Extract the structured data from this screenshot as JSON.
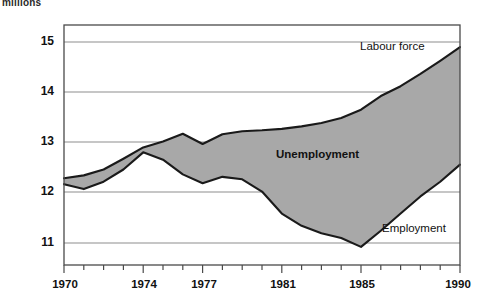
{
  "chart_data": {
    "type": "area",
    "title": "",
    "subtitle": "",
    "ylabel": "millions",
    "xlabel": "",
    "xlim": [
      1970,
      1990
    ],
    "ylim": [
      10.55,
      15.45
    ],
    "grid": true,
    "legend_position": "inline-annotations",
    "xticks": [
      1970,
      1974,
      1977,
      1981,
      1985,
      1990
    ],
    "xtick_labels": [
      "1970",
      "1974",
      "1977",
      "1981",
      "1985",
      "1990"
    ],
    "xminor_ticks": [
      1971,
      1972,
      1973,
      1975,
      1976,
      1978,
      1979,
      1980,
      1982,
      1983,
      1984,
      1986,
      1987,
      1988,
      1989
    ],
    "yticks": [
      11,
      12,
      13,
      14,
      15
    ],
    "ytick_labels": [
      "11",
      "12",
      "13",
      "14",
      "15"
    ],
    "x": [
      1970,
      1971,
      1972,
      1973,
      1974,
      1975,
      1976,
      1977,
      1978,
      1979,
      1980,
      1981,
      1982,
      1983,
      1984,
      1985,
      1986,
      1987,
      1988,
      1989,
      1990
    ],
    "series": [
      {
        "name": "Labour force",
        "values": [
          12.32,
          12.38,
          12.5,
          12.72,
          12.95,
          13.07,
          13.23,
          13.02,
          13.22,
          13.28,
          13.3,
          13.33,
          13.38,
          13.45,
          13.55,
          13.72,
          14.0,
          14.2,
          14.45,
          14.72,
          15.0
        ]
      },
      {
        "name": "Employment",
        "values": [
          12.2,
          12.1,
          12.25,
          12.5,
          12.85,
          12.7,
          12.4,
          12.22,
          12.35,
          12.3,
          12.05,
          11.6,
          11.35,
          11.2,
          11.1,
          10.92,
          11.25,
          11.6,
          11.95,
          12.25,
          12.6
        ]
      }
    ],
    "shaded_band": {
      "name": "Unemployment",
      "between": [
        "Labour force",
        "Employment"
      ],
      "color": "#a8a8a8"
    },
    "annotations": [
      {
        "text": "Labour force",
        "x": 1984.0,
        "y": 14.62,
        "bold": false
      },
      {
        "text": "Unemployment",
        "x": 1980.6,
        "y": 12.87,
        "bold": true
      },
      {
        "text": "Employment",
        "x": 1986.6,
        "y": 11.12,
        "bold": false
      }
    ],
    "colors": {
      "line": "#1a1a1a",
      "band": "#a8a8a8",
      "grid": "#8d8d8d",
      "frame": "#4a4a4a",
      "background": "#ffffff"
    }
  },
  "labels": {
    "yaxis_title": "millions",
    "labour_force": "Labour force",
    "unemployment": "Unemployment",
    "employment": "Employment",
    "y15": "15",
    "y14": "14",
    "y13": "13",
    "y12": "12",
    "y11": "11",
    "x1970": "1970",
    "x1974": "1974",
    "x1977": "1977",
    "x1981": "1981",
    "x1985": "1985",
    "x1990": "1990"
  }
}
